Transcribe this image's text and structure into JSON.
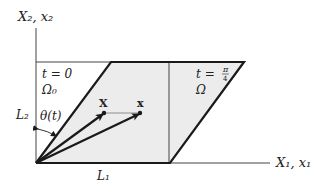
{
  "axes": {
    "vertical_label": "X₂, x₂",
    "horizontal_label": "X₁, x₁"
  },
  "reference_config": {
    "time_label": "t = 0",
    "domain_label": "Ω₀",
    "height_label": "L₂",
    "width_label": "L₁"
  },
  "current_config": {
    "time_label_prefix": "t = ",
    "time_fraction_num": "π",
    "time_fraction_den": "4",
    "domain_label": "Ω"
  },
  "angle_label": "θ(t)",
  "points": {
    "reference_point": "X",
    "current_point": "x"
  },
  "colors": {
    "shear_fill": "#ececec",
    "stroke": "#1a1a1a",
    "axis": "#444444"
  }
}
